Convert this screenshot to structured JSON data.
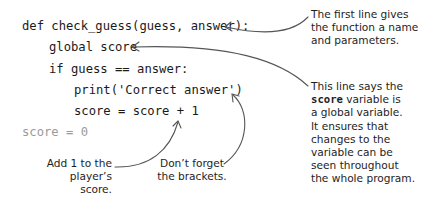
{
  "code": {
    "lines": [
      {
        "text": "def check_guess(guess, answer):",
        "indent": 0
      },
      {
        "text": "global score",
        "indent": 1
      },
      {
        "text": "if guess == answer:",
        "indent": 1
      },
      {
        "text": "print('Correct answer')",
        "indent": 2
      },
      {
        "text": "score = score + 1",
        "indent": 2
      },
      {
        "text": "score = 0",
        "indent": 0,
        "dimmed": true
      }
    ]
  },
  "annotations": {
    "first_line": {
      "lines": [
        "The first line gives",
        "the function a name",
        "and parameters."
      ]
    },
    "global_score": {
      "prefix": "This line says the",
      "keyword": "score",
      "suffix": " variable is",
      "lines": [
        "a global variable.",
        "It ensures that",
        "changes to the",
        "variable can be",
        "seen throughout",
        "the whole program."
      ]
    },
    "add_one": {
      "lines": [
        "Add 1 to the",
        "player’s score."
      ]
    },
    "brackets": {
      "lines": [
        "Don’t forget",
        "the brackets."
      ]
    }
  },
  "colors": {
    "code_text": "#1a1a1a",
    "dimmed_code": "#9a9a9a",
    "arrow": "#555555"
  }
}
